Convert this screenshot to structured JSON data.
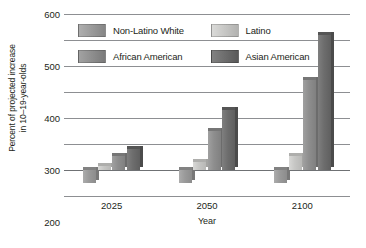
{
  "chart_data": {
    "type": "bar",
    "title": "",
    "subtitle": "",
    "xlabel": "Year",
    "ylabel": "Percent of projected increase in 10–19-year-olds",
    "ylabel_lines": [
      "Percent of projected increase",
      "in 10–19-year-olds"
    ],
    "categories": [
      "2025",
      "2050",
      "2100"
    ],
    "yticks": [
      "600",
      "500",
      "400",
      "300",
      "200",
      "100",
      "0",
      "–10"
    ],
    "ytick_values": [
      600,
      500,
      400,
      300,
      200,
      100,
      0,
      -10
    ],
    "ylim": [
      -10,
      600
    ],
    "grid": true,
    "legend_position": "inside-top-left",
    "series": [
      {
        "name": "Non-Latino White",
        "color": "#9a9a9a",
        "values": [
          -5,
          -5,
          -5
        ]
      },
      {
        "name": "Latino",
        "color": "#c6c6c4",
        "values": [
          15,
          30,
          55
        ]
      },
      {
        "name": "African American",
        "color": "#8e8e8e",
        "values": [
          55,
          150,
          345
        ]
      },
      {
        "name": "Asian American",
        "color": "#6d6d6d",
        "values": [
          80,
          230,
          520
        ]
      }
    ]
  }
}
